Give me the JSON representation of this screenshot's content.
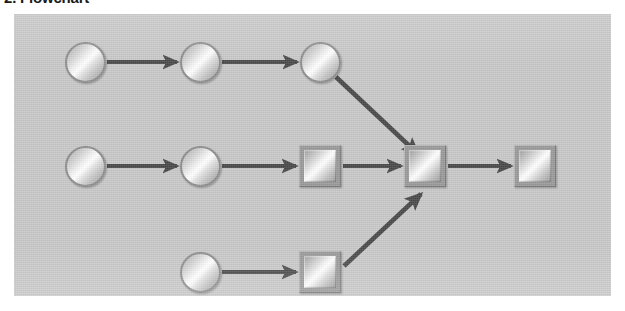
{
  "page": {
    "title": "2. Flowchart"
  },
  "figure": {
    "name": "flowchart-diagram",
    "background_color": "#c9c9c9",
    "arrow_color": "#4a4a4a",
    "node_fill_highlight": "#ffffff",
    "node_fill_shadow": "#9c9c9c",
    "node_border_color": "#8e8e8e",
    "width": 597,
    "height": 282
  },
  "diagram_data": {
    "type": "diagram",
    "shape_legend": {
      "circle": "circle-node",
      "square": "square-node"
    },
    "rows": [
      {
        "row": 1,
        "label": "top-branch",
        "center_y": 48,
        "nodes": [
          {
            "id": "r1n1",
            "shape": "circle",
            "cx": 71,
            "cy": 48,
            "size": 41
          },
          {
            "id": "r1n2",
            "shape": "circle",
            "cx": 186,
            "cy": 48,
            "size": 41
          },
          {
            "id": "r1n3",
            "shape": "circle",
            "cx": 306,
            "cy": 48,
            "size": 41
          }
        ]
      },
      {
        "row": 2,
        "label": "middle-trunk",
        "center_y": 152,
        "nodes": [
          {
            "id": "r2n1",
            "shape": "circle",
            "cx": 71,
            "cy": 152,
            "size": 41
          },
          {
            "id": "r2n2",
            "shape": "circle",
            "cx": 186,
            "cy": 152,
            "size": 41
          },
          {
            "id": "r2n3",
            "shape": "square",
            "cx": 306,
            "cy": 152,
            "size": 42
          },
          {
            "id": "r2n4",
            "shape": "square",
            "cx": 411,
            "cy": 152,
            "size": 42
          },
          {
            "id": "r2n5",
            "shape": "square",
            "cx": 521,
            "cy": 152,
            "size": 42
          }
        ]
      },
      {
        "row": 3,
        "label": "bottom-branch",
        "center_y": 258,
        "nodes": [
          {
            "id": "r3n1",
            "shape": "circle",
            "cx": 186,
            "cy": 258,
            "size": 41
          },
          {
            "id": "r3n2",
            "shape": "square",
            "cx": 306,
            "cy": 258,
            "size": 42
          }
        ]
      }
    ],
    "edges": [
      {
        "id": "e1",
        "from": "r1n1",
        "to": "r1n2",
        "kind": "horizontal"
      },
      {
        "id": "e2",
        "from": "r1n2",
        "to": "r1n3",
        "kind": "horizontal"
      },
      {
        "id": "e3",
        "from": "r1n3",
        "to": "r2n4",
        "kind": "diagonal-down"
      },
      {
        "id": "e4",
        "from": "r2n1",
        "to": "r2n2",
        "kind": "horizontal"
      },
      {
        "id": "e5",
        "from": "r2n2",
        "to": "r2n3",
        "kind": "horizontal"
      },
      {
        "id": "e6",
        "from": "r2n3",
        "to": "r2n4",
        "kind": "horizontal"
      },
      {
        "id": "e7",
        "from": "r2n4",
        "to": "r2n5",
        "kind": "horizontal"
      },
      {
        "id": "e8",
        "from": "r3n1",
        "to": "r3n2",
        "kind": "horizontal"
      },
      {
        "id": "e9",
        "from": "r3n2",
        "to": "r2n4",
        "kind": "diagonal-up"
      }
    ],
    "node_count": 10,
    "edge_count": 9,
    "circle_count": 6,
    "square_count": 4
  }
}
